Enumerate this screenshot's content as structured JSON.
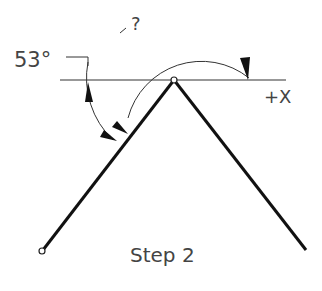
{
  "diagram": {
    "angle_known_label": "53°",
    "angle_unknown_label": "?",
    "axis_label": "+X",
    "step_label": "Step 2",
    "colors": {
      "background": "#ffffff",
      "lines": "#111111",
      "thin_lines": "#333333",
      "text": "#444444"
    },
    "geometry": {
      "apex": [
        174,
        80
      ],
      "left_end": [
        42,
        251
      ],
      "right_end": [
        307,
        251
      ],
      "x_axis": [
        [
          60,
          80
        ],
        [
          286,
          80
        ]
      ]
    }
  }
}
